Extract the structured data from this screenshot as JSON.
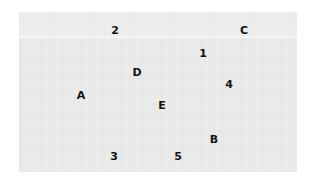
{
  "figure": {
    "type": "scatter-label-plate",
    "background_color": "#ffffff",
    "plate_color": "#e9e9e9",
    "plate_top_band_color": "#ececec",
    "plate_seam_color": "#f6f6f6",
    "label_color": "#141414",
    "plate_bounds": {
      "x": 19,
      "y": 12,
      "width": 278,
      "height": 160
    },
    "top_band_height": 24
  },
  "labels": [
    {
      "text": "2",
      "x": 115,
      "y": 30,
      "kind": "number"
    },
    {
      "text": "C",
      "x": 244,
      "y": 30,
      "kind": "letter"
    },
    {
      "text": "1",
      "x": 203,
      "y": 53,
      "kind": "number"
    },
    {
      "text": "D",
      "x": 137,
      "y": 72,
      "kind": "letter"
    },
    {
      "text": "4",
      "x": 229,
      "y": 84,
      "kind": "number"
    },
    {
      "text": "A",
      "x": 81,
      "y": 95,
      "kind": "letter"
    },
    {
      "text": "E",
      "x": 162,
      "y": 105,
      "kind": "letter"
    },
    {
      "text": "B",
      "x": 214,
      "y": 139,
      "kind": "letter"
    },
    {
      "text": "3",
      "x": 114,
      "y": 156,
      "kind": "number"
    },
    {
      "text": "5",
      "x": 178,
      "y": 156,
      "kind": "number"
    }
  ]
}
